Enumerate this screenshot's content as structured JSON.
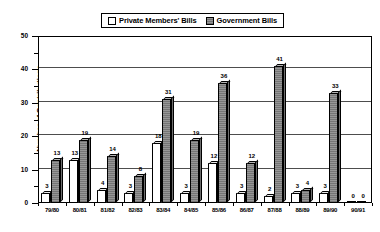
{
  "chart_data": {
    "type": "bar",
    "title": "",
    "xlabel": "",
    "ylabel": "Number of Contributions",
    "ylim": [
      0,
      50
    ],
    "yticks": [
      0,
      10,
      20,
      30,
      40,
      50
    ],
    "grid": true,
    "legend_position": "top-center",
    "categories": [
      "79/80",
      "80/81",
      "81/82",
      "82/83",
      "83/84",
      "84/85",
      "85/86",
      "86/87",
      "87/88",
      "88/89",
      "89/90",
      "90/91"
    ],
    "series": [
      {
        "name": "Private Members' Bills",
        "color": "#ffffff",
        "values": [
          3,
          13,
          4,
          3,
          18,
          3,
          12,
          3,
          2,
          3,
          3,
          0
        ]
      },
      {
        "name": "Government Bills",
        "color": "#8c8c8c",
        "values": [
          13,
          19,
          14,
          8,
          31,
          19,
          36,
          12,
          41,
          4,
          33,
          0
        ]
      }
    ]
  },
  "legend": {
    "entries": [
      {
        "label": "Private Members' Bills",
        "swatch": "private"
      },
      {
        "label": "Government Bills",
        "swatch": "government"
      }
    ]
  },
  "axis": {
    "y_title": "Number of Contributions",
    "y_tick_labels": [
      "0",
      "10",
      "20",
      "30",
      "40",
      "50"
    ]
  }
}
